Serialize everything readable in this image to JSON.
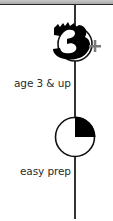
{
  "attributes": [
    {
      "icon": "age-3-plus-icon",
      "badge_text": "3+",
      "label": "age 3 & up"
    },
    {
      "icon": "prep-time-clock-icon",
      "filled_fraction": 0.25,
      "label": "easy prep"
    }
  ],
  "colors": {
    "ink": "#000000",
    "line": "#333333",
    "text": "#2b2b2b",
    "plus": "#7a7a7a",
    "top_band": "#b5b5b5"
  }
}
